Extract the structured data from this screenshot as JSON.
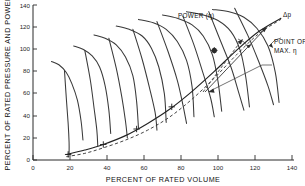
{
  "figure": {
    "name": "fan-performance-map",
    "background": "#ffffff",
    "line_color": "#3a3a3a"
  },
  "chart_data": {
    "type": "line",
    "title": "",
    "xlabel": "PERCENT OF RATED VOLUME",
    "ylabel": "PERCENT OF RATED PRESSURE AND POWER",
    "xlim": [
      0,
      140
    ],
    "ylim": [
      0,
      140
    ],
    "xticks": [
      0,
      20,
      40,
      60,
      80,
      100,
      120,
      140
    ],
    "xticklabels": [
      "0",
      "20",
      "40",
      "60",
      "80",
      "100",
      "120",
      "140"
    ],
    "yticks": [
      0,
      20,
      40,
      60,
      80,
      100,
      120,
      140
    ],
    "yticklabels": [
      "0",
      "20",
      "40",
      "60",
      "80",
      "100",
      "120",
      "140"
    ],
    "grid": false,
    "legend_position": "none",
    "annotations": [
      {
        "id": "power-label",
        "text": "POWER (η)",
        "x": 62,
        "y": 136
      },
      {
        "id": "delta-p-label",
        "text": "Δp",
        "x": 122,
        "y": 137
      },
      {
        "id": "max-eta-label-line1",
        "text": "POINT OF",
        "x": 118,
        "y": 113
      },
      {
        "id": "max-eta-label-line2",
        "text": "MAX.  η",
        "x": 118,
        "y": 105
      }
    ],
    "point_of_max_efficiency": {
      "x": 98,
      "y": 99
    },
    "series": [
      {
        "name": "delta-p-curve-1",
        "kind": "pressure",
        "x": [
          10,
          14,
          18,
          21,
          24,
          26,
          27
        ],
        "y": [
          89,
          86,
          79,
          69,
          54,
          35,
          18
        ]
      },
      {
        "name": "delta-p-curve-2",
        "kind": "pressure",
        "x": [
          22,
          27,
          32,
          36,
          39,
          41,
          42
        ],
        "y": [
          103,
          100,
          94,
          84,
          67,
          45,
          24
        ]
      },
      {
        "name": "delta-p-curve-3",
        "kind": "pressure",
        "x": [
          33,
          39,
          45,
          50,
          54,
          56,
          57
        ],
        "y": [
          113,
          110,
          104,
          93,
          76,
          53,
          29
        ]
      },
      {
        "name": "delta-p-curve-4",
        "kind": "pressure",
        "x": [
          45,
          52,
          59,
          64,
          68,
          71,
          72
        ],
        "y": [
          121,
          118,
          112,
          101,
          84,
          60,
          34
        ]
      },
      {
        "name": "delta-p-curve-5",
        "kind": "pressure",
        "x": [
          57,
          65,
          72,
          78,
          83,
          86,
          87
        ],
        "y": [
          127,
          124,
          118,
          107,
          90,
          66,
          39
        ]
      },
      {
        "name": "delta-p-curve-6",
        "kind": "pressure",
        "x": [
          70,
          78,
          86,
          92,
          97,
          100,
          102
        ],
        "y": [
          131,
          128,
          122,
          112,
          95,
          71,
          44
        ]
      },
      {
        "name": "delta-p-curve-7",
        "kind": "pressure",
        "x": [
          83,
          92,
          100,
          107,
          112,
          115,
          117
        ],
        "y": [
          134,
          131,
          126,
          116,
          99,
          75,
          48
        ]
      },
      {
        "name": "delta-p-curve-8",
        "kind": "pressure",
        "x": [
          97,
          106,
          114,
          121,
          127,
          131,
          133
        ],
        "y": [
          136,
          134,
          129,
          119,
          103,
          79,
          52
        ]
      },
      {
        "name": "power-curve-1",
        "kind": "power",
        "x": [
          17,
          18,
          19,
          19.5,
          19.5
        ],
        "y": [
          81,
          56,
          33,
          16,
          5
        ]
      },
      {
        "name": "power-curve-2",
        "kind": "power",
        "x": [
          28,
          31,
          33,
          34.5,
          35
        ],
        "y": [
          99,
          72,
          47,
          27,
          13
        ]
      },
      {
        "name": "power-curve-3",
        "kind": "power",
        "x": [
          41,
          45,
          48,
          50,
          51
        ],
        "y": [
          110,
          83,
          57,
          35,
          20
        ]
      },
      {
        "name": "power-curve-4",
        "kind": "power",
        "x": [
          54,
          59,
          63,
          66,
          67
        ],
        "y": [
          118,
          91,
          65,
          43,
          27
        ]
      },
      {
        "name": "power-curve-5",
        "kind": "power",
        "x": [
          67,
          73,
          78,
          81,
          83
        ],
        "y": [
          125,
          98,
          72,
          50,
          33
        ]
      },
      {
        "name": "power-curve-6",
        "kind": "power",
        "x": [
          81,
          87,
          92,
          96,
          98
        ],
        "y": [
          130,
          104,
          78,
          56,
          39
        ]
      },
      {
        "name": "power-curve-7",
        "kind": "power",
        "x": [
          95,
          101,
          107,
          111,
          114
        ],
        "y": [
          134,
          109,
          84,
          62,
          45
        ]
      },
      {
        "name": "power-curve-8",
        "kind": "power",
        "x": [
          109,
          116,
          122,
          127,
          130
        ],
        "y": [
          137,
          113,
          89,
          67,
          50
        ]
      },
      {
        "name": "system-curve-solid",
        "kind": "system",
        "x": [
          18,
          28,
          38,
          50,
          62,
          74,
          86,
          98,
          110,
          122,
          134
        ],
        "y": [
          5,
          9,
          14,
          22,
          33,
          46,
          62,
          80,
          99,
          116,
          128
        ]
      },
      {
        "name": "system-curve-dashed",
        "kind": "system-dashed",
        "x": [
          18,
          28,
          38,
          50,
          62,
          74,
          86,
          98,
          110,
          122,
          134
        ],
        "y": [
          3,
          6,
          11,
          18,
          27,
          39,
          55,
          74,
          95,
          114,
          127
        ]
      }
    ],
    "intersection_markers": [
      {
        "x": 19,
        "y": 5
      },
      {
        "x": 38,
        "y": 14
      },
      {
        "x": 56,
        "y": 28
      },
      {
        "x": 75,
        "y": 48
      },
      {
        "x": 98,
        "y": 99
      }
    ]
  }
}
